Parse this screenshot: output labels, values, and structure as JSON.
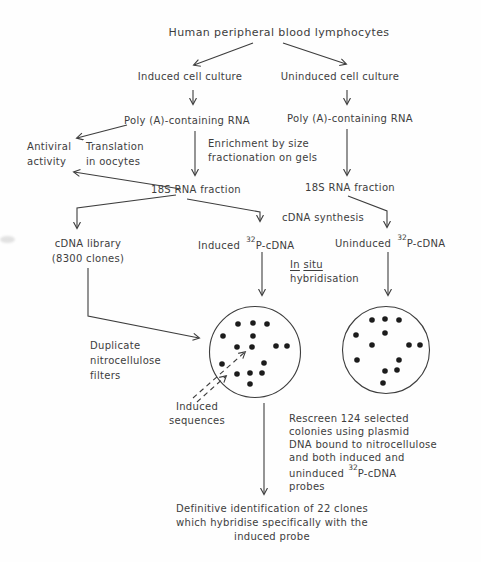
{
  "diagram": {
    "title": "Human peripheral blood lymphocytes",
    "induced_culture": "Induced cell culture",
    "uninduced_culture": "Uninduced cell culture",
    "poly_a_left": "Poly (A)-containing RNA",
    "poly_a_right": "Poly (A)-containing RNA",
    "antiviral": {
      "line1": "Antiviral",
      "line2": "activity"
    },
    "translation": {
      "line1": "Translation",
      "line2": "in oocytes"
    },
    "enrichment": {
      "line1": "Enrichment by size",
      "line2": "fractionation on gels"
    },
    "rna_18s_left": "18S RNA fraction",
    "rna_18s_right": "18S RNA fraction",
    "cdna_synthesis": "cDNA synthesis",
    "cdna_library": {
      "line1": "cDNA library",
      "line2": "(8300 clones)"
    },
    "induced_probe": {
      "name": "Induced",
      "isotope": "32",
      "molecule": "P-cDNA"
    },
    "uninduced_probe": {
      "name": "Uninduced",
      "isotope": "32",
      "molecule": "P-cDNA"
    },
    "in_situ": {
      "word1": "In",
      "word2": "situ",
      "line2": "hybridisation"
    },
    "duplicate_filters": {
      "line1": "Duplicate",
      "line2": "nitrocellulose",
      "line3": "filters"
    },
    "induced_sequences": {
      "line1": "Induced",
      "line2": "sequences"
    },
    "rescreen": {
      "line1": "Rescreen 124 selected",
      "line2": "colonies using plasmid",
      "line3": "DNA bound to nitrocellulose",
      "line4": "and both induced and",
      "line5_prefix": "uninduced",
      "line5_isotope": "32",
      "line5_suffix": "P-cDNA",
      "line6": "probes"
    },
    "conclusion": {
      "line1": "Definitive identification of 22 clones",
      "line2": "which hybridise specifically with the",
      "line3": "induced probe"
    }
  },
  "filters": {
    "left": {
      "dots": [
        [
          238,
          324
        ],
        [
          253,
          323
        ],
        [
          267,
          324
        ],
        [
          223,
          336
        ],
        [
          253,
          336
        ],
        [
          237,
          347
        ],
        [
          252,
          347
        ],
        [
          276,
          346
        ],
        [
          287,
          346
        ],
        [
          222,
          364
        ],
        [
          264,
          363
        ],
        [
          237,
          374
        ],
        [
          250,
          373
        ],
        [
          262,
          373
        ],
        [
          250,
          384
        ]
      ]
    },
    "right": {
      "dots": [
        [
          372,
          320
        ],
        [
          385,
          319
        ],
        [
          399,
          320
        ],
        [
          356,
          335
        ],
        [
          385,
          333
        ],
        [
          372,
          345
        ],
        [
          409,
          345
        ],
        [
          420,
          345
        ],
        [
          357,
          360
        ],
        [
          399,
          360
        ],
        [
          385,
          371
        ],
        [
          397,
          370
        ],
        [
          383,
          383
        ]
      ]
    }
  },
  "colors": {
    "ink": "#3d3d3d",
    "dot": "#1c1c1c",
    "background": "#fefefe"
  }
}
